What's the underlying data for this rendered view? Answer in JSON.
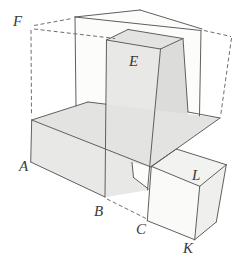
{
  "figure": {
    "type": "geometry-diagram",
    "colors": {
      "background": "#ffffff",
      "edge_stroke": "#5f5f5f",
      "dashed_stroke": "#6e6e6e",
      "label_color": "#3a3a3a",
      "face_top_gray": "#e3e3e1",
      "face_front_gray": "#e8e8e6",
      "face_side_gray": "#dcdcda",
      "face_white": "#fcfcfb",
      "cube_top": "#f2f2f0",
      "cube_front": "#fafaf8",
      "cube_right": "#efefed"
    },
    "faces": [
      {
        "name": "rear-box-front-face",
        "fill": "face_white",
        "points": "75,17 201,30.5 199.5,116 76,106"
      },
      {
        "name": "rear-box-top-face",
        "fill": "face_white",
        "points": "75,17 140,10 202,29 201,30.5"
      },
      {
        "name": "tower-top-face",
        "fill": "face_top_gray",
        "points": "106.5,40 128,29.5 183,38.5 160.5,49"
      },
      {
        "name": "tower-front-face",
        "fill": "face_front_gray",
        "points": "106.5,40 160.5,49 147.5,190 105,197"
      },
      {
        "name": "tower-right-face",
        "fill": "face_side_gray",
        "points": "160.5,49 183,38.5 188,112 147.5,190"
      },
      {
        "name": "slab-top-face",
        "fill": "face_top_gray",
        "points": "31.7,120 88,102 220,118 151,167"
      },
      {
        "name": "slab-front-face",
        "fill": "face_front_gray",
        "points": "31.7,120 151,167 147.5,190 105,197 30.7,162"
      },
      {
        "name": "slab-end-face",
        "fill": "face_white",
        "points": "132,162.5 151,167 148.5,189 133.5,177.5"
      },
      {
        "name": "cube-top-face",
        "fill": "cube_top",
        "points": "151.3,166.3 176.3,149 226.3,164.7 199.7,186.3"
      },
      {
        "name": "cube-front-face",
        "fill": "cube_front",
        "points": "151.3,166.3 199.7,186.3 194.7,239.7 147.3,220.7"
      },
      {
        "name": "cube-right-face",
        "fill": "cube_right",
        "points": "199.7,186.3 226.3,164.7 216.3,222 194.7,239.7"
      }
    ],
    "edges": [
      {
        "name": "rear-box-top-left-edge",
        "points": "75,17 140,10"
      },
      {
        "name": "rear-box-top-right-edge",
        "points": "140,10 202,29"
      },
      {
        "name": "rear-box-top-front-edge",
        "points": "75,17 201,30.5"
      },
      {
        "name": "rear-box-left-vertical",
        "points": "75,17 76,106"
      },
      {
        "name": "rear-box-right-vertical",
        "points": "201,30.5 199.5,116"
      },
      {
        "name": "tower-top-rear-left-edge",
        "points": "106.5,40 128,29.5"
      },
      {
        "name": "tower-top-rear-edge",
        "points": "128,29.5 183,38.5"
      },
      {
        "name": "tower-top-right-edge",
        "points": "183,38.5 160.5,49"
      },
      {
        "name": "tower-top-front-edge",
        "points": "160.5,49 106.5,40"
      },
      {
        "name": "tower-front-left-vertical",
        "points": "106.5,40 105,197"
      },
      {
        "name": "tower-front-right-vertical",
        "points": "160.5,49 147.5,190"
      },
      {
        "name": "tower-rear-right-vertical",
        "points": "183,38.5 188,112"
      },
      {
        "name": "slab-top-left-edge",
        "points": "31.7,120 88,102"
      },
      {
        "name": "slab-top-rear-edge-left",
        "points": "88,102 106,104.2"
      },
      {
        "name": "slab-top-rear-edge-right",
        "points": "188,112 220,118"
      },
      {
        "name": "slab-top-front-edge",
        "points": "31.7,120 151,167"
      },
      {
        "name": "slab-front-left-vertical",
        "points": "31.7,120 30.7,162"
      },
      {
        "name": "slab-bottom-front-edge",
        "points": "30.7,162 105,197"
      },
      {
        "name": "slab-end-top-edge",
        "points": "220,118 151,167"
      },
      {
        "name": "slab-end-left-edge",
        "points": "132,162.5 133.5,177.5"
      },
      {
        "name": "slab-end-bottom-edge",
        "points": "133.5,177.5 148.5,189"
      },
      {
        "name": "cube-top-rear-left-edge",
        "points": "151.3,166.3 176.3,149"
      },
      {
        "name": "cube-top-rear-right-edge",
        "points": "176.3,149 226.3,164.7"
      },
      {
        "name": "cube-top-right-edge",
        "points": "226.3,164.7 199.7,186.3"
      },
      {
        "name": "cube-top-front-edge",
        "points": "199.7,186.3 151.3,166.3"
      },
      {
        "name": "cube-front-left-vertical",
        "points": "151.3,166.3 147.3,220.7"
      },
      {
        "name": "cube-bottom-front-edge",
        "points": "147.3,220.7 194.7,239.7"
      },
      {
        "name": "cube-front-right-vertical",
        "points": "199.7,186.3 194.7,239.7"
      },
      {
        "name": "cube-rear-right-vertical",
        "points": "226.3,164.7 216.3,222"
      },
      {
        "name": "cube-bottom-right-edge",
        "points": "216.3,222 194.7,239.7"
      }
    ],
    "dashed_edges": [
      {
        "name": "box-front-left-vertical-dashed",
        "points": "31,30 31.5,116"
      },
      {
        "name": "box-top-left-dashed",
        "points": "34,25.5 72,18.5"
      },
      {
        "name": "box-top-front-dashed",
        "points": "34,29 115,38.5"
      },
      {
        "name": "box-top-right-dashed",
        "points": "204,30.5 231,36.5"
      },
      {
        "name": "box-right-vertical-dashed",
        "points": "231.5,38 220.5,116.5"
      },
      {
        "name": "box-bottom-front-dashed",
        "points": "107,199 146,218.5"
      }
    ],
    "vertex_labels": [
      {
        "text": "F",
        "x": 13,
        "y": 26
      },
      {
        "text": "E",
        "x": 129,
        "y": 66
      },
      {
        "text": "A",
        "x": 19,
        "y": 171
      },
      {
        "text": "B",
        "x": 94,
        "y": 216
      },
      {
        "text": "C",
        "x": 136,
        "y": 234
      },
      {
        "text": "K",
        "x": 183,
        "y": 253
      },
      {
        "text": "L",
        "x": 192,
        "y": 180
      }
    ]
  }
}
